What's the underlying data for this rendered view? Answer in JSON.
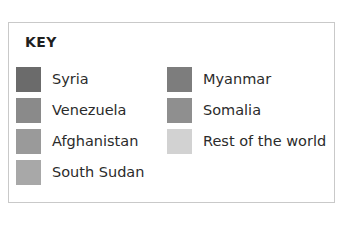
{
  "legend": {
    "title": "KEY",
    "border_color": "#c9c9c9",
    "background_color": "#ffffff",
    "text_color": "#2b2b2b",
    "columns": [
      {
        "items": [
          {
            "label": "Syria",
            "color": "#6b6b6b"
          },
          {
            "label": "Venezuela",
            "color": "#8a8a8a"
          },
          {
            "label": "Afghanistan",
            "color": "#9a9a9a"
          },
          {
            "label": "South Sudan",
            "color": "#a8a8a8"
          }
        ]
      },
      {
        "items": [
          {
            "label": "Myanmar",
            "color": "#7d7d7d"
          },
          {
            "label": "Somalia",
            "color": "#8f8f8f"
          },
          {
            "label": "Rest of the world",
            "color": "#d2d2d2"
          }
        ]
      }
    ]
  },
  "chart_data": {
    "type": "table",
    "title": "KEY",
    "categories": [
      "Syria",
      "Venezuela",
      "Afghanistan",
      "South Sudan",
      "Myanmar",
      "Somalia",
      "Rest of the world"
    ],
    "series": [
      {
        "name": "legend-swatch-colors",
        "values": [
          "#6b6b6b",
          "#8a8a8a",
          "#9a9a9a",
          "#a8a8a8",
          "#7d7d7d",
          "#8f8f8f",
          "#d2d2d2"
        ]
      }
    ],
    "legend_position": "standalone",
    "grid": false,
    "xlabel": "",
    "ylabel": ""
  }
}
